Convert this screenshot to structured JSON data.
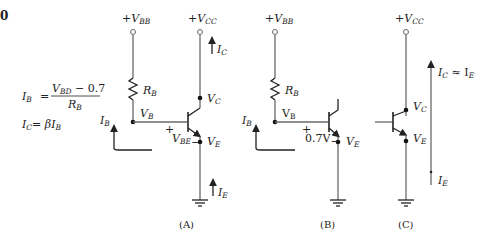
{
  "figure_number_fragment": "0",
  "equations": {
    "ib": {
      "lhs": "I",
      "lhs_sub": "B",
      "eq": "=",
      "num_v": "V",
      "num_v_sub": "BD",
      "num_rest": " − 0.7",
      "den": "R",
      "den_sub": "B"
    },
    "ic": {
      "lhs": "I",
      "lhs_sub": "C",
      "rhs": "= βI",
      "rhs_sub": "B"
    }
  },
  "circuits": [
    {
      "caption": "(A)",
      "vbb": {
        "prefix": "+V",
        "sub": "BB"
      },
      "vcc": {
        "prefix": "+V",
        "sub": "CC"
      },
      "rb": {
        "main": "R",
        "sub": "B"
      },
      "vb": {
        "main": "V",
        "sub": "B"
      },
      "vc": {
        "main": "V",
        "sub": "C"
      },
      "ve": {
        "main": "V",
        "sub": "E"
      },
      "vbe": {
        "plus": "+",
        "main": "V",
        "sub": "BE",
        "minus": "−"
      },
      "ib": {
        "main": "I",
        "sub": "B"
      },
      "ic": {
        "main": "I",
        "sub": "C"
      },
      "ie": {
        "main": "I",
        "sub": "E"
      }
    },
    {
      "caption": "(B)",
      "vbb": {
        "prefix": "+V",
        "sub": "BB"
      },
      "rb": {
        "main": "R",
        "sub": "B"
      },
      "vb": {
        "main": "V",
        "sub": "B"
      },
      "ve": {
        "main": "V",
        "sub": "E"
      },
      "vbe": {
        "plus": "+",
        "value": "0.7V",
        "minus": "−"
      },
      "ib": {
        "main": "I",
        "sub": "B"
      }
    },
    {
      "caption": "(C)",
      "vcc": {
        "prefix": "+V",
        "sub": "CC"
      },
      "vc": {
        "main": "V",
        "sub": "C"
      },
      "ve": {
        "main": "V",
        "sub": "E"
      },
      "ic_ie": {
        "main": "I",
        "sub": "C",
        "approx": " ≈ I",
        "sub2": "E"
      },
      "ie": {
        "main": "I",
        "sub": "E"
      }
    }
  ],
  "colors": {
    "wire": "#6a6a6a",
    "ink": "#222222",
    "background": "#ffffff"
  }
}
